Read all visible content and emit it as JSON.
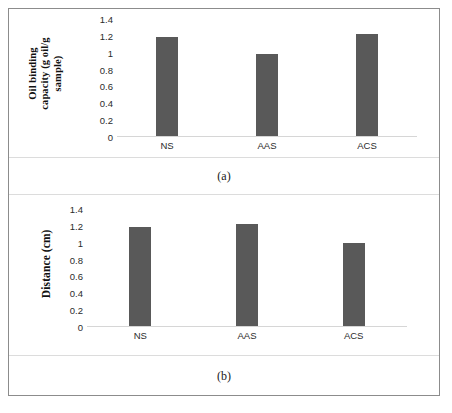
{
  "figure": {
    "background_color": "#ffffff",
    "frame_color": "#8c8c8c",
    "bar_color": "#595959",
    "axis_color": "#d6d6d6"
  },
  "panels": [
    {
      "key": "a",
      "caption": "(a)",
      "ytitle_line1": "Oil binding",
      "ytitle_line2": "capacity (g oil/g",
      "ytitle_line3": "sample)"
    },
    {
      "key": "b",
      "caption": "(b)",
      "ytitle_line1": "Distance (cm)"
    }
  ],
  "chart_data": [
    {
      "type": "bar",
      "panel": "a",
      "title": "",
      "xlabel": "",
      "ylabel": "Oil binding capacity (g oil/g sample)",
      "categories": [
        "NS",
        "AAS",
        "ACS"
      ],
      "values": [
        1.18,
        0.97,
        1.21
      ],
      "yticks": [
        "1.4",
        "1.2",
        "1",
        "0.8",
        "0.6",
        "0.4",
        "0.2",
        "0"
      ],
      "ytick_values": [
        1.4,
        1.2,
        1.0,
        0.8,
        0.6,
        0.4,
        0.2,
        0
      ],
      "ylim": [
        0,
        1.4
      ],
      "grid": false,
      "legend": "none",
      "series_color": "#595959"
    },
    {
      "type": "bar",
      "panel": "b",
      "title": "",
      "xlabel": "",
      "ylabel": "Distance (cm)",
      "categories": [
        "NS",
        "AAS",
        "ACS"
      ],
      "values": [
        1.18,
        1.21,
        0.98
      ],
      "yticks": [
        "1.4",
        "1.2",
        "1",
        "0.8",
        "0.6",
        "0.4",
        "0.2",
        "0"
      ],
      "ytick_values": [
        1.4,
        1.2,
        1.0,
        0.8,
        0.6,
        0.4,
        0.2,
        0
      ],
      "ylim": [
        0,
        1.4
      ],
      "grid": false,
      "legend": "none",
      "series_color": "#595959"
    }
  ]
}
